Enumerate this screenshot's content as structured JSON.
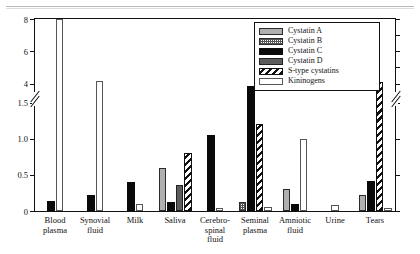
{
  "chart_data": {
    "type": "bar",
    "title": "",
    "xlabel": "",
    "ylabel": "",
    "grid": false,
    "legend_position": "top-right",
    "axis_break": true,
    "ylim_lower": [
      0,
      1.5
    ],
    "ylim_upper": [
      3.2,
      8
    ],
    "yticks_lower": [
      "0",
      "0.5",
      "1.0",
      "1.5"
    ],
    "yticks_lower_values": [
      0,
      0.5,
      1.0,
      1.5
    ],
    "yticks_upper": [
      "4",
      "6",
      "8"
    ],
    "yticks_upper_values": [
      4,
      6,
      8
    ],
    "categories": [
      "Blood plasma",
      "Synovial fluid",
      "Milk",
      "Saliva",
      "Cerebro-spinal fluid",
      "Seminal plasma",
      "Amniotic fluid",
      "Urine",
      "Tears"
    ],
    "category_lines": [
      [
        "Blood",
        "plasma"
      ],
      [
        "Synovial",
        "fluid"
      ],
      [
        "Milk"
      ],
      [
        "Saliva"
      ],
      [
        "Cerebro-",
        "spinal",
        "fluid"
      ],
      [
        "Seminal",
        "plasma"
      ],
      [
        "Amniotic",
        "fluid"
      ],
      [
        "Urine"
      ],
      [
        "Tears"
      ]
    ],
    "series": [
      {
        "name": "Cystatin A",
        "key": "a",
        "pattern": "solid-gray",
        "color": "#b0b0b0",
        "values": [
          0,
          0,
          0,
          0.6,
          0,
          0,
          0.3,
          0,
          0.22
        ]
      },
      {
        "name": "Cystatin B",
        "key": "b",
        "pattern": "dotted-check",
        "color": "#ffffff",
        "values": [
          0,
          0,
          0,
          0,
          0,
          0.13,
          0,
          0,
          0
        ]
      },
      {
        "name": "Cystatin C",
        "key": "c",
        "pattern": "solid-black",
        "color": "#0a0a0a",
        "values": [
          0.14,
          0.22,
          0.4,
          0.13,
          1.05,
          3.85,
          0.1,
          0,
          0.42
        ]
      },
      {
        "name": "Cystatin D",
        "key": "d",
        "pattern": "dark-gray",
        "color": "#5c5c5c",
        "values": [
          0,
          0,
          0,
          0.36,
          0,
          0,
          0,
          0,
          0
        ]
      },
      {
        "name": "S-type cystatins",
        "key": "s",
        "pattern": "diagonal-hatch",
        "color": "#ffffff",
        "values": [
          0,
          0,
          0,
          0.8,
          0,
          1.2,
          0,
          0,
          4.1
        ]
      },
      {
        "name": "Kininogens",
        "key": "k",
        "pattern": "open-white",
        "color": "#ffffff",
        "values": [
          8.0,
          4.15,
          0.1,
          0,
          0.04,
          0.05,
          1.0,
          0.08,
          0.04
        ]
      }
    ],
    "legend_entries": [
      {
        "label": "Cystatin A",
        "swatch": "solid-gray"
      },
      {
        "label": "Cystatin B",
        "swatch": "dotted-check"
      },
      {
        "label": "Cystatin C",
        "swatch": "solid-black"
      },
      {
        "label": "Cystatin D",
        "swatch": "dark-gray"
      },
      {
        "label": "S-type cystatins",
        "swatch": "diagonal-hatch"
      },
      {
        "label": "Kininogens",
        "swatch": "open-white"
      }
    ]
  }
}
